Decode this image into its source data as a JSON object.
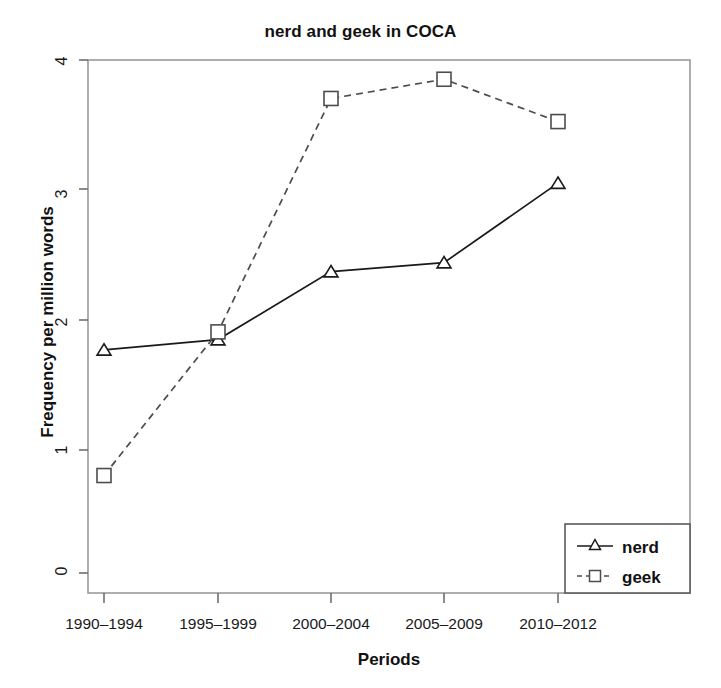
{
  "chart_data": {
    "type": "line",
    "title": "nerd and geek in COCA",
    "xlabel": "Periods",
    "ylabel": "Frequency per million words",
    "categories": [
      "1990–1994",
      "1995–1999",
      "2000–2004",
      "2005–2009",
      "2010–2012"
    ],
    "ylim": [
      0,
      4
    ],
    "xlim": [
      0,
      6
    ],
    "y_ticks": [
      "0",
      "1",
      "2",
      "3",
      "4"
    ],
    "y_tick_values": [
      0,
      1,
      2,
      3,
      4
    ],
    "grid": false,
    "legend_position": "bottom-right",
    "series": [
      {
        "name": "nerd",
        "values": [
          1.74,
          1.82,
          2.35,
          2.42,
          3.04
        ],
        "line_style": "solid",
        "marker": "triangle",
        "color": "#1a1a1a"
      },
      {
        "name": "geek",
        "values": [
          0.76,
          1.88,
          3.7,
          3.85,
          3.52
        ],
        "line_style": "dashed",
        "marker": "square",
        "color": "#4d4d4d"
      }
    ]
  },
  "legend": {
    "entries": [
      {
        "label": "nerd",
        "marker": "triangle-marker",
        "style": "solid"
      },
      {
        "label": "geek",
        "marker": "square-marker",
        "style": "dashed"
      }
    ]
  },
  "axes": {
    "y_tick_0": "0",
    "y_tick_1": "1",
    "y_tick_2": "2",
    "y_tick_3": "3",
    "y_tick_4": "4",
    "x_tick_0": "1990–1994",
    "x_tick_1": "1995–1999",
    "x_tick_2": "2000–2004",
    "x_tick_3": "2005–2009",
    "x_tick_4": "2010–2012"
  },
  "colors": {
    "frame": "#9a9a9a",
    "nerd_line": "#1a1a1a",
    "geek_line": "#4d4d4d",
    "text": "#111111",
    "background": "#ffffff"
  }
}
